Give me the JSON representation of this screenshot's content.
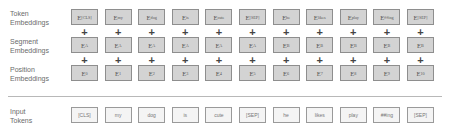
{
  "labels": {
    "token": [
      "Token",
      "Embeddings"
    ],
    "segment": [
      "Segment",
      "Embeddings"
    ],
    "position": [
      "Position",
      "Embeddings"
    ],
    "input": [
      "Input",
      "Tokens"
    ]
  },
  "token_embeddings": [
    "[CLS]",
    "my",
    "dog",
    "is",
    "cute",
    "[SEP]",
    "he",
    "likes",
    "play",
    "##ing",
    "[SEP]"
  ],
  "segment_embeddings": [
    "A",
    "A",
    "A",
    "A",
    "A",
    "A",
    "B",
    "B",
    "B",
    "B",
    "B"
  ],
  "position_embeddings": [
    "0",
    "1",
    "2",
    "3",
    "4",
    "5",
    "6",
    "7",
    "8",
    "9",
    "10"
  ],
  "input_tokens": [
    "[CLS]",
    "my",
    "dog",
    "is",
    "cute",
    "[SEP]",
    "he",
    "likes",
    "play",
    "##ing",
    "[SEP]"
  ],
  "embedding_prefix": "E",
  "plus_symbol": "+",
  "colors": {
    "embedding_fill": "#d3d3d3",
    "embedding_border": "#8e8e8e",
    "input_fill": "#f4f4f4",
    "divider": "#b8b8b8"
  }
}
